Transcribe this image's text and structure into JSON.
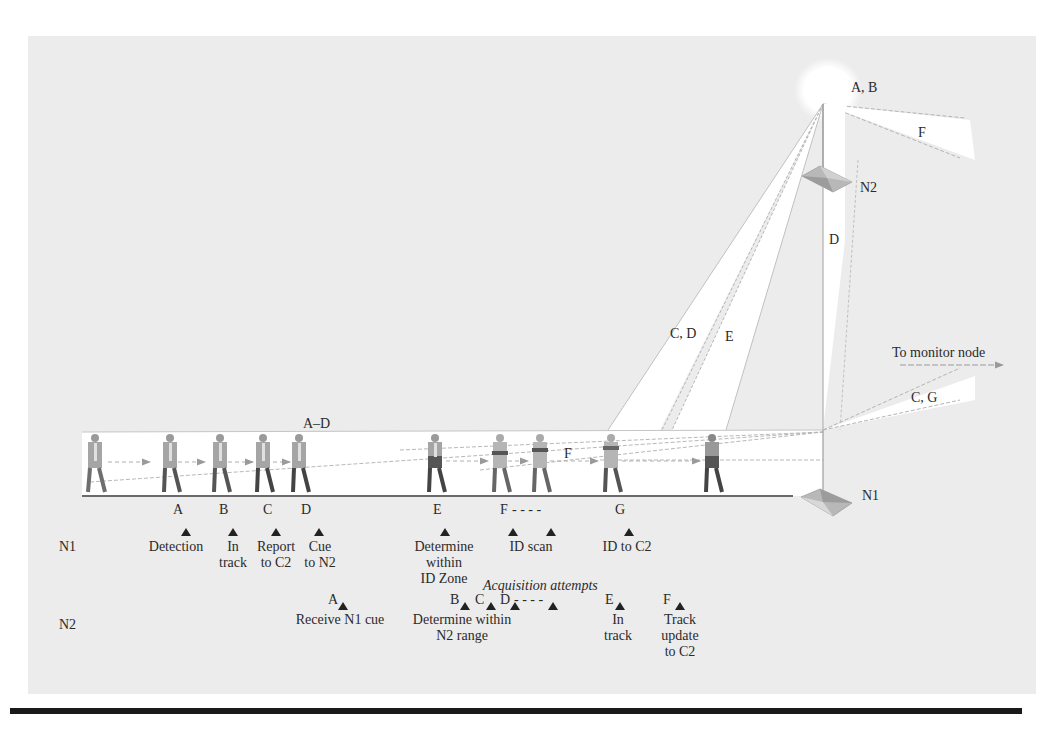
{
  "figure": {
    "beam_labels": {
      "ab": "A, B",
      "f_top": "F",
      "n2": "N2",
      "d": "D",
      "cd": "C, D",
      "e": "E",
      "monitor": "To monitor node",
      "cg": "C, G",
      "a_d": "A–D",
      "f_mid": "F",
      "n1": "N1"
    },
    "ground_markers": [
      "A",
      "B",
      "C",
      "D",
      "E",
      "F",
      "G"
    ],
    "ground_f_dashes": "- - - -",
    "n1_row": {
      "label": "N1",
      "markers": [
        "A",
        "B",
        "C",
        "D",
        "E",
        "F",
        "G"
      ],
      "f_dashes": "- - - -",
      "events": [
        {
          "line1": "Detection",
          "line2": ""
        },
        {
          "line1": "In",
          "line2": "track"
        },
        {
          "line1": "Report",
          "line2": "to C2"
        },
        {
          "line1": "Cue",
          "line2": "to N2"
        },
        {
          "line1": "Determine",
          "line2": "within",
          "line3": "ID Zone"
        },
        {
          "line1": "ID scan",
          "line2": ""
        },
        {
          "line1": "ID to C2",
          "line2": ""
        }
      ]
    },
    "acquisition_label": "Acquisition attempts",
    "n2_row": {
      "label": "N2",
      "markers": [
        "A",
        "B",
        "C",
        "D",
        "E",
        "F"
      ],
      "d_dashes": "- - - -",
      "events": [
        {
          "line1": "Receive N1 cue"
        },
        {
          "line1": "Determine within",
          "line2": "N2 range"
        },
        {
          "line1": "In",
          "line2": "track"
        },
        {
          "line1": "Track",
          "line2": "update",
          "line3": "to C2"
        }
      ]
    }
  }
}
